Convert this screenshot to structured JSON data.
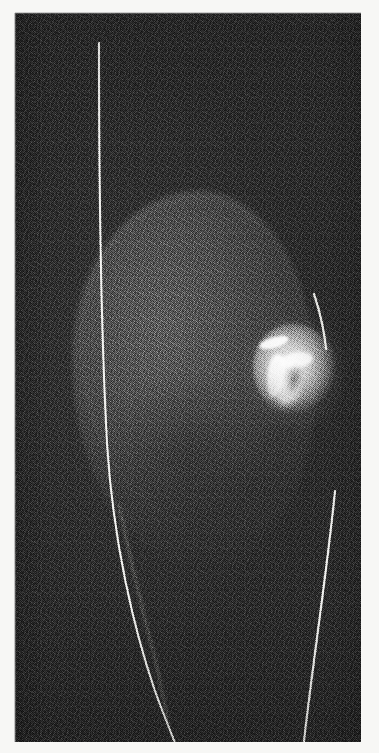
{
  "figure": {
    "kind": "scanned-greyscale-medical-image",
    "modality_appearance": "ultrasound / radiographic film scan",
    "orientation": "portrait",
    "caption": "",
    "has_text_labels": false,
    "has_annotations_text": false
  },
  "plate": {
    "background_color": "#2b2b2b",
    "paper_color": "#f7f7f5",
    "grain": "heavy halftone print noise"
  },
  "structures": [
    {
      "name": "tissue-mass",
      "description": "large soft rounded grey mass occupying the centre-left of the frame",
      "fill_color": "#3a3a3a",
      "approx_center": "x 180, y 367",
      "approx_size": "245 x 380"
    },
    {
      "name": "lesion",
      "description": "bright hyperechoic nodule with irregular white streaks, right of centre",
      "fill_color": "#e8e8e6",
      "approx_center": "x 279, y 357",
      "approx_size": "82 x 92"
    }
  ],
  "marker_lines": [
    {
      "name": "left-marker-line",
      "description": "long bright near-vertical line descending from top and curving right at the bottom",
      "color": "#f2f2ee",
      "start": "x 84, y 30",
      "end": "x 163, y 737"
    },
    {
      "name": "left-secondary-line",
      "description": "fainter parallel line branching below mid-frame",
      "color": "#9a9a96",
      "start": "x 108, y 500",
      "end": "x 152, y 700"
    },
    {
      "name": "right-upper-line",
      "description": "short bright arc along the right border of the mass",
      "color": "#f0f0ec",
      "start": "x 300, y 281",
      "end": "x 311, y 336"
    },
    {
      "name": "right-marker-line",
      "description": "bright line descending from mid-right down to the lower border",
      "color": "#f2f2ee",
      "start": "x 320, y 478",
      "end": "x 288, y 737"
    }
  ],
  "colors": {
    "background": "#2b2b2b",
    "mass": "#3a3a3a",
    "lesion_bright": "#ededea",
    "line_bright": "#f2f2ee",
    "paper": "#f7f7f5"
  }
}
